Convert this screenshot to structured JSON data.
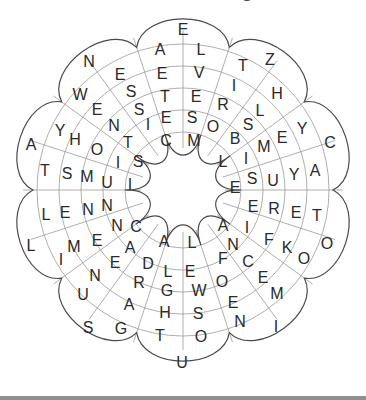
{
  "puzzle": {
    "type": "circular word search flower",
    "petal_tips": [
      "E",
      "Z",
      "C",
      "O",
      "I",
      "U",
      "S",
      "L",
      "A",
      "N"
    ],
    "letters": [
      {
        "ch": "E",
        "x": 183,
        "y": 30
      },
      {
        "ch": "A",
        "x": 160,
        "y": 50
      },
      {
        "ch": "L",
        "x": 201,
        "y": 50
      },
      {
        "ch": "E",
        "x": 162,
        "y": 74
      },
      {
        "ch": "V",
        "x": 199,
        "y": 73
      },
      {
        "ch": "T",
        "x": 165,
        "y": 97
      },
      {
        "ch": "E",
        "x": 196,
        "y": 97
      },
      {
        "ch": "E",
        "x": 166,
        "y": 118
      },
      {
        "ch": "S",
        "x": 192,
        "y": 118
      },
      {
        "ch": "C",
        "x": 166,
        "y": 141
      },
      {
        "ch": "M",
        "x": 194,
        "y": 141
      },
      {
        "ch": "N",
        "x": 89,
        "y": 62
      },
      {
        "ch": "E",
        "x": 120,
        "y": 75
      },
      {
        "ch": "W",
        "x": 80,
        "y": 95
      },
      {
        "ch": "S",
        "x": 131,
        "y": 92
      },
      {
        "ch": "E",
        "x": 97,
        "y": 110
      },
      {
        "ch": "S",
        "x": 139,
        "y": 110
      },
      {
        "ch": "N",
        "x": 114,
        "y": 126
      },
      {
        "ch": "I",
        "x": 148,
        "y": 125
      },
      {
        "ch": "T",
        "x": 128,
        "y": 143
      },
      {
        "ch": "S",
        "x": 138,
        "y": 162
      },
      {
        "ch": "O",
        "x": 97,
        "y": 150
      },
      {
        "ch": "I",
        "x": 118,
        "y": 163
      },
      {
        "ch": "H",
        "x": 75,
        "y": 140
      },
      {
        "ch": "Y",
        "x": 60,
        "y": 131
      },
      {
        "ch": "A",
        "x": 31,
        "y": 145
      },
      {
        "ch": "T",
        "x": 45,
        "y": 171
      },
      {
        "ch": "S",
        "x": 67,
        "y": 174
      },
      {
        "ch": "M",
        "x": 87,
        "y": 177
      },
      {
        "ch": "U",
        "x": 107,
        "y": 183
      },
      {
        "ch": "I",
        "x": 130,
        "y": 185
      },
      {
        "ch": "Z",
        "x": 270,
        "y": 60
      },
      {
        "ch": "T",
        "x": 243,
        "y": 66
      },
      {
        "ch": "H",
        "x": 277,
        "y": 94
      },
      {
        "ch": "I",
        "x": 234,
        "y": 86
      },
      {
        "ch": "L",
        "x": 260,
        "y": 111
      },
      {
        "ch": "R",
        "x": 223,
        "y": 105
      },
      {
        "ch": "S",
        "x": 248,
        "y": 125
      },
      {
        "ch": "O",
        "x": 213,
        "y": 127
      },
      {
        "ch": "B",
        "x": 235,
        "y": 139
      },
      {
        "ch": "M",
        "x": 264,
        "y": 147
      },
      {
        "ch": "E",
        "x": 282,
        "y": 138
      },
      {
        "ch": "Y",
        "x": 302,
        "y": 129
      },
      {
        "ch": "C",
        "x": 330,
        "y": 143
      },
      {
        "ch": "L",
        "x": 223,
        "y": 162
      },
      {
        "ch": "I",
        "x": 246,
        "y": 159
      },
      {
        "ch": "S",
        "x": 252,
        "y": 179
      },
      {
        "ch": "U",
        "x": 273,
        "y": 181
      },
      {
        "ch": "Y",
        "x": 294,
        "y": 175
      },
      {
        "ch": "A",
        "x": 315,
        "y": 171
      },
      {
        "ch": "E",
        "x": 235,
        "y": 188
      },
      {
        "ch": "E",
        "x": 253,
        "y": 207
      },
      {
        "ch": "R",
        "x": 274,
        "y": 209
      },
      {
        "ch": "E",
        "x": 296,
        "y": 213
      },
      {
        "ch": "T",
        "x": 317,
        "y": 216
      },
      {
        "ch": "O",
        "x": 327,
        "y": 244
      },
      {
        "ch": "A",
        "x": 223,
        "y": 226
      },
      {
        "ch": "I",
        "x": 247,
        "y": 228
      },
      {
        "ch": "F",
        "x": 269,
        "y": 240
      },
      {
        "ch": "K",
        "x": 287,
        "y": 248
      },
      {
        "ch": "O",
        "x": 304,
        "y": 259
      },
      {
        "ch": "N",
        "x": 233,
        "y": 245
      },
      {
        "ch": "C",
        "x": 248,
        "y": 262
      },
      {
        "ch": "E",
        "x": 263,
        "y": 278
      },
      {
        "ch": "M",
        "x": 277,
        "y": 294
      },
      {
        "ch": "F",
        "x": 223,
        "y": 259
      },
      {
        "ch": "O",
        "x": 222,
        "y": 282
      },
      {
        "ch": "E",
        "x": 233,
        "y": 303
      },
      {
        "ch": "N",
        "x": 240,
        "y": 322
      },
      {
        "ch": "I",
        "x": 276,
        "y": 327
      },
      {
        "ch": "A",
        "x": 164,
        "y": 242
      },
      {
        "ch": "L",
        "x": 192,
        "y": 243
      },
      {
        "ch": "D",
        "x": 148,
        "y": 264
      },
      {
        "ch": "L",
        "x": 168,
        "y": 272
      },
      {
        "ch": "E",
        "x": 190,
        "y": 272
      },
      {
        "ch": "G",
        "x": 167,
        "y": 291
      },
      {
        "ch": "W",
        "x": 199,
        "y": 291
      },
      {
        "ch": "R",
        "x": 139,
        "y": 283
      },
      {
        "ch": "H",
        "x": 165,
        "y": 313
      },
      {
        "ch": "S",
        "x": 198,
        "y": 314
      },
      {
        "ch": "A",
        "x": 129,
        "y": 305
      },
      {
        "ch": "T",
        "x": 160,
        "y": 336
      },
      {
        "ch": "O",
        "x": 201,
        "y": 337
      },
      {
        "ch": "G",
        "x": 121,
        "y": 329
      },
      {
        "ch": "U",
        "x": 182,
        "y": 363
      },
      {
        "ch": "L",
        "x": 46,
        "y": 215
      },
      {
        "ch": "E",
        "x": 65,
        "y": 213
      },
      {
        "ch": "N",
        "x": 88,
        "y": 210
      },
      {
        "ch": "N",
        "x": 107,
        "y": 206
      },
      {
        "ch": "C",
        "x": 136,
        "y": 227
      },
      {
        "ch": "N",
        "x": 117,
        "y": 226
      },
      {
        "ch": "E",
        "x": 97,
        "y": 241
      },
      {
        "ch": "M",
        "x": 74,
        "y": 247
      },
      {
        "ch": "I",
        "x": 61,
        "y": 260
      },
      {
        "ch": "L",
        "x": 31,
        "y": 246
      },
      {
        "ch": "A",
        "x": 130,
        "y": 248
      },
      {
        "ch": "E",
        "x": 115,
        "y": 263
      },
      {
        "ch": "N",
        "x": 95,
        "y": 276
      },
      {
        "ch": "U",
        "x": 83,
        "y": 295
      },
      {
        "ch": "S",
        "x": 88,
        "y": 328
      }
    ]
  }
}
